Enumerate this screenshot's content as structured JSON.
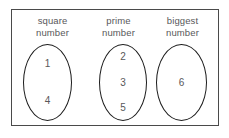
{
  "diagram": {
    "groups": [
      {
        "label_line1": "square",
        "label_line2": "number",
        "items": [
          "1",
          "4"
        ]
      },
      {
        "label_line1": "prime",
        "label_line2": "number",
        "items": [
          "2",
          "3",
          "5"
        ]
      },
      {
        "label_line1": "biggest",
        "label_line2": "number",
        "items": [
          "6"
        ]
      }
    ]
  },
  "colors": {
    "border": "#4a4a4a",
    "ellipse": "#1d1d1d",
    "text": "#58585a",
    "background": "#ffffff"
  }
}
